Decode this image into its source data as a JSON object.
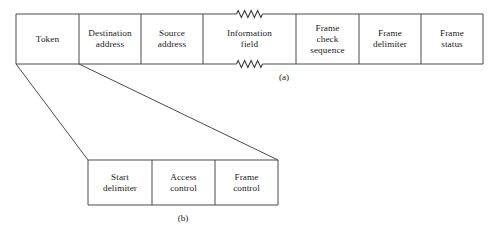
{
  "figure": {
    "background_color": "#ffffff",
    "line_color": "#4a4a4a",
    "text_color": "#1a1a1a"
  },
  "frame_a": {
    "caption": "(a)",
    "cells": [
      {
        "label": "Token",
        "lines": [
          "Token"
        ],
        "x": 16,
        "width": 63
      },
      {
        "label": "Destination address",
        "lines": [
          "Destination",
          "address"
        ],
        "x": 79,
        "width": 62
      },
      {
        "label": "Source address",
        "lines": [
          "Source",
          "address"
        ],
        "x": 141,
        "width": 62
      },
      {
        "label": "Information field",
        "lines": [
          "Information",
          "field"
        ],
        "x": 203,
        "width": 93,
        "broken": true
      },
      {
        "label": "Frame check sequence",
        "lines": [
          "Frame",
          "check",
          "sequence"
        ],
        "x": 296,
        "width": 63
      },
      {
        "label": "Frame delimiter",
        "lines": [
          "Frame",
          "delimiter"
        ],
        "x": 359,
        "width": 62
      },
      {
        "label": "Frame status",
        "lines": [
          "Frame",
          "status"
        ],
        "x": 421,
        "width": 62
      }
    ],
    "top": 14,
    "bottom": 64,
    "caption_x": 284,
    "caption_y": 72
  },
  "frame_b": {
    "caption": "(b)",
    "cells": [
      {
        "label": "Start delimiter",
        "lines": [
          "Start",
          "delimiter"
        ],
        "x": 88,
        "width": 64
      },
      {
        "label": "Access control",
        "lines": [
          "Access",
          "control"
        ],
        "x": 152,
        "width": 63
      },
      {
        "label": "Frame control",
        "lines": [
          "Frame",
          "control"
        ],
        "x": 215,
        "width": 63
      }
    ],
    "top": 160,
    "bottom": 205,
    "caption_x": 183,
    "caption_y": 213
  },
  "expansion_lines": [
    {
      "name": "left-leader",
      "x1": 16,
      "y1": 64,
      "x2": 88,
      "y2": 160
    },
    {
      "name": "right-leader",
      "x1": 79,
      "y1": 64,
      "x2": 278,
      "y2": 160
    }
  ]
}
